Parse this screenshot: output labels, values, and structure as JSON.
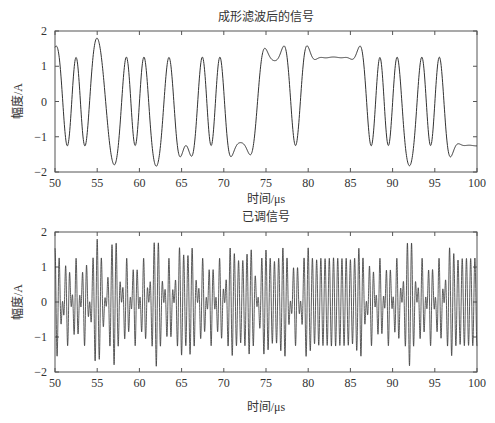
{
  "chart_data": [
    {
      "type": "line",
      "title": "成形滤波后的信号",
      "xlabel": "时间/μs",
      "ylabel": "幅度/A",
      "xlim": [
        50,
        100
      ],
      "ylim": [
        -2,
        2
      ],
      "xticks": [
        50,
        55,
        60,
        65,
        70,
        75,
        80,
        85,
        90,
        95,
        100
      ],
      "yticks": [
        -2,
        -1,
        0,
        1,
        2
      ],
      "grid": false,
      "description": "Pulse-shaped (raised-cosine filtered) bipolar baseband signal, amplitude ~±1.2 to ±1.45",
      "bit_sequence_1us": [
        1,
        -1,
        1,
        -1,
        1,
        1,
        -1,
        -1,
        1,
        -1,
        1,
        -1,
        -1,
        1,
        -1,
        -1,
        -1,
        1,
        -1,
        1,
        -1,
        -1,
        -1,
        -1,
        1,
        1,
        1,
        1,
        -1,
        1,
        1,
        1,
        1,
        1,
        1,
        1,
        1,
        -1,
        1,
        -1,
        1,
        -1,
        -1,
        1,
        -1,
        1,
        -1,
        -1,
        -1,
        -1
      ],
      "series": [
        {
          "name": "shaped",
          "peak_values": [
            1.2,
            1.45,
            -1.2,
            -1.45,
            1.3,
            -1.3
          ]
        }
      ]
    },
    {
      "type": "line",
      "title": "已调信号",
      "xlabel": "时间/μs",
      "ylabel": "幅度/A",
      "xlim": [
        50,
        100
      ],
      "ylim": [
        -2,
        2
      ],
      "xticks": [
        50,
        55,
        60,
        65,
        70,
        75,
        80,
        85,
        90,
        95,
        100
      ],
      "yticks": [
        -2,
        -1,
        0,
        1,
        2
      ],
      "grid": false,
      "description": "Modulated signal: shaped baseband multiplied by a carrier (~2 MHz), envelope follows top signal",
      "carrier_MHz": 2
    }
  ],
  "labels": {
    "top_title": "成形滤波后的信号",
    "bottom_title": "已调信号",
    "ylabel": "幅度/A",
    "xlabel": "时间/μs",
    "xticks": [
      "50",
      "55",
      "60",
      "65",
      "70",
      "75",
      "80",
      "85",
      "90",
      "95",
      "100"
    ],
    "yticks": [
      "2",
      "1",
      "0",
      "−1",
      "−2"
    ]
  }
}
